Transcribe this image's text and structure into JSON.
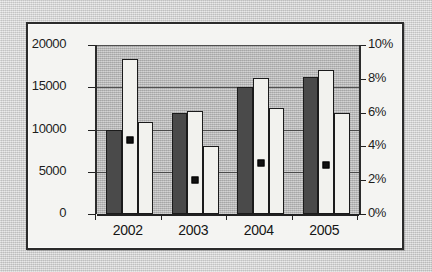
{
  "chart_data": {
    "type": "bar",
    "title": "",
    "subtitle": "",
    "xlabel": "",
    "ylabel": "",
    "y2label": "",
    "categories": [
      "2002",
      "2003",
      "2004",
      "2005"
    ],
    "ylim": [
      0,
      20000
    ],
    "y2lim": [
      0,
      10
    ],
    "y_ticks": [
      "0",
      "5000",
      "10000",
      "15000",
      "20000"
    ],
    "y_tick_values": [
      0,
      5000,
      10000,
      15000,
      20000
    ],
    "y2_ticks": [
      "0%",
      "2%",
      "4%",
      "6%",
      "8%",
      "10%"
    ],
    "y2_tick_values": [
      0,
      2,
      4,
      6,
      8,
      10
    ],
    "grid": true,
    "legend": "none",
    "series": [
      {
        "name": "series-1",
        "type": "bar",
        "axis": "left",
        "color": "#4a4a4a",
        "values": [
          10000,
          11900,
          15000,
          16200
        ]
      },
      {
        "name": "series-2",
        "type": "bar",
        "axis": "left",
        "color": "#f2f2ee",
        "values": [
          18300,
          12200,
          16100,
          17000
        ]
      },
      {
        "name": "series-3",
        "type": "bar",
        "axis": "left",
        "color": "#f2f2ee",
        "values": [
          10900,
          8000,
          12500,
          11900
        ]
      },
      {
        "name": "series-4",
        "type": "marker",
        "axis": "right",
        "color": "#111111",
        "values": [
          4.4,
          2.0,
          3.0,
          2.9
        ]
      }
    ]
  }
}
